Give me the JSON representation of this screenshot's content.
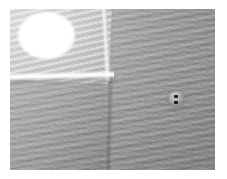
{
  "image": {
    "domain": "Natural-Image",
    "subject": "Close-up photograph of light grey woven fabric garment",
    "alt_text": "Close-up of a light grey woven garment showing a pocket flap with a bright white circular highlight at upper left, a vertical seam, and a small two-hole button at right.",
    "frame": {
      "width_px": 227,
      "height_px": 179,
      "border_color": "#ffffff",
      "border_width_px": 10
    },
    "canvas": {
      "width_px": 205,
      "height_px": 161,
      "base_color": "#9a9a9a"
    },
    "palette": {
      "fabric_light": "#c9c9c9",
      "fabric_mid": "#a2a2a2",
      "fabric_dark": "#8f8f8f",
      "highlight_white": "#ffffff",
      "seam_shadow": "#4a4a4a",
      "button_body": "#b0b0b0",
      "button_hole": "#1b1b1b",
      "paper_border": "#ffffff"
    },
    "regions": [
      {
        "name": "pocket-flap",
        "label": "Pocket flap panel",
        "position": "upper-left",
        "tone": "#c9c9c9"
      },
      {
        "name": "white-circle",
        "label": "Bright white circular highlight",
        "position": "upper-left of flap",
        "tone": "#ffffff"
      },
      {
        "name": "flap-hem",
        "label": "Bright hem highlight along flap bottom edge",
        "position": "below flap",
        "tone": "#ffffff"
      },
      {
        "name": "vertical-seam",
        "label": "Vertical seam / fold line",
        "position": "center-left, runs top to bottom",
        "tone": "#4a4a4a"
      },
      {
        "name": "button",
        "label": "Two-hole button",
        "position": "right of center",
        "tone": "#b0b0b0",
        "hole_count": 2
      },
      {
        "name": "weave-texture",
        "label": "Diagonal wavy weave stripe texture",
        "position": "entire fabric surface",
        "tone": "#a2a2a2"
      }
    ]
  }
}
